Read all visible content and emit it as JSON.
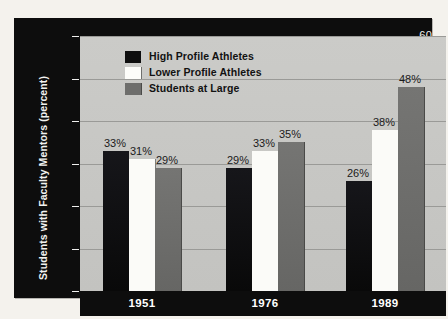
{
  "chart_data": {
    "type": "bar",
    "title": "",
    "xlabel": "",
    "ylabel": "Students with Faculty Mentors (percent)",
    "categories": [
      "1951",
      "1976",
      "1989"
    ],
    "ylim": [
      0,
      60
    ],
    "yticks": [
      0,
      10,
      20,
      30,
      40,
      50,
      60
    ],
    "ytick_labels": [
      "0",
      "10",
      "20",
      "30",
      "40",
      "50",
      "60"
    ],
    "grid": true,
    "legend_position": "upper-left-inside",
    "series": [
      {
        "name": "High Profile Athletes",
        "color": "#111111",
        "values": [
          33,
          29,
          26
        ],
        "value_labels": [
          "33%",
          "29%",
          "26%"
        ]
      },
      {
        "name": "Lower Profile Athletes",
        "color": "#fbfbf8",
        "values": [
          31,
          33,
          38
        ],
        "value_labels": [
          "31%",
          "33%",
          "38%"
        ]
      },
      {
        "name": "Students at Large",
        "color": "#6e6e6c",
        "values": [
          29,
          35,
          48
        ],
        "value_labels": [
          "29%",
          "35%",
          "48%"
        ]
      }
    ]
  },
  "colors": {
    "page_background": "#f4f2ed",
    "frame": "#0d0d0d",
    "plot_background": "#c7c7c4",
    "gridline": "#9a9a97",
    "axis_text": "#f2f2f0",
    "value_text": "#1a1a1a"
  }
}
